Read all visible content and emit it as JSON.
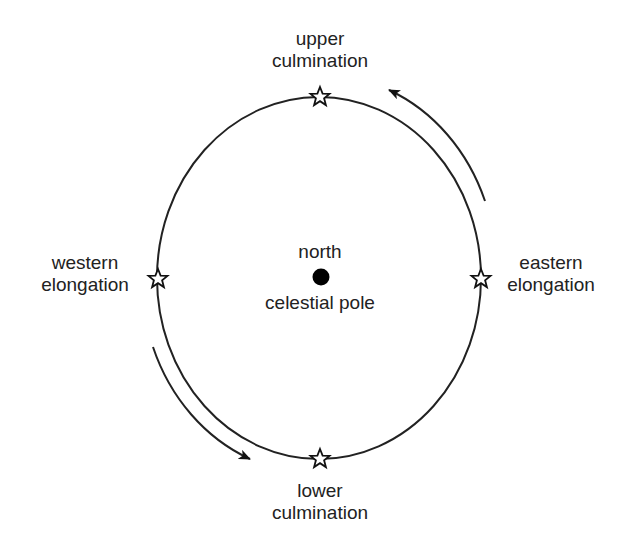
{
  "diagram": {
    "type": "circumpolar-star-path",
    "center_label": {
      "line1": "north",
      "line2": "celestial pole"
    },
    "positions": {
      "upper": {
        "line1": "upper",
        "line2": "culmination"
      },
      "lower": {
        "line1": "lower",
        "line2": "culmination"
      },
      "western": {
        "line1": "western",
        "line2": "elongation"
      },
      "eastern": {
        "line1": "eastern",
        "line2": "elongation"
      }
    },
    "arrows": [
      {
        "name": "east-to-upper",
        "direction": "counterclockwise"
      },
      {
        "name": "west-to-lower",
        "direction": "counterclockwise"
      }
    ],
    "colors": {
      "stroke": "#222222",
      "star_fill": "#ffffff",
      "pole_fill": "#000000",
      "background": "#ffffff"
    }
  }
}
